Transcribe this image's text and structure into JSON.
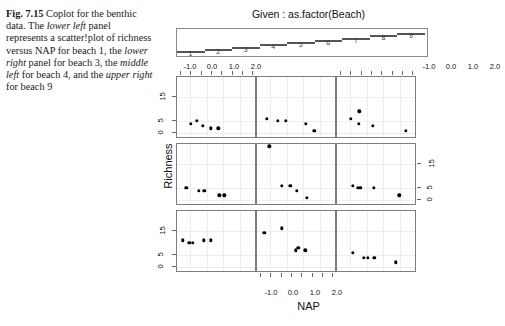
{
  "caption": {
    "fig_label": "Fig. 7.15",
    "line_1": "Coplot for the",
    "line_2_a": "benthic data. The ",
    "line_2_i": "lower left",
    "line_3": "panel represents a",
    "line_4": "scatter!plot of richness versus",
    "line_5_a": "NAP for beach 1, the ",
    "line_5_i": "lower",
    "line_6_i": "right",
    "line_6_b": " panel for beach 3, the",
    "line_7_i": "middle left",
    "line_7_b": " for beach 4, and",
    "line_8_a": "the ",
    "line_8_i": "upper right",
    "line_8_b": " for beach 9"
  },
  "given": {
    "title": "Given : as.factor(Beach)",
    "levels": [
      "1",
      "2",
      "3",
      "4",
      "5",
      "6",
      "7",
      "8",
      "9"
    ]
  },
  "axes": {
    "xlabel": "NAP",
    "ylabel": "Richness",
    "xticks": [
      "-1.0",
      "0.0",
      "1.0",
      "2.0"
    ],
    "xtick_values": [
      -1.0,
      0.0,
      1.0,
      2.0
    ],
    "yticks": [
      "0",
      "5",
      "15"
    ],
    "ytick_values": [
      0,
      5,
      15
    ],
    "xlim": [
      -1.8,
      2.9
    ],
    "ylim": [
      -1.5,
      23
    ]
  },
  "chart_data": {
    "type": "scatter",
    "title": "Given : as.factor(Beach)",
    "xlabel": "NAP",
    "ylabel": "Richness",
    "conditioning_variable": "as.factor(Beach)",
    "xlim": [
      -1.8,
      2.9
    ],
    "ylim": [
      -1.5,
      23
    ],
    "grid": true,
    "layout": "3x3 coplot, rows bottom-to-top = beaches 1-3, 4-6, 7-9",
    "panels": [
      {
        "beach": "1",
        "row": 2,
        "col": 0,
        "points": [
          {
            "x": -1.45,
            "y": 11
          },
          {
            "x": -1.05,
            "y": 10
          },
          {
            "x": -0.85,
            "y": 10
          },
          {
            "x": -0.2,
            "y": 11
          },
          {
            "x": 0.25,
            "y": 11
          }
        ]
      },
      {
        "beach": "2",
        "row": 2,
        "col": 1,
        "points": [
          {
            "x": -1.35,
            "y": 14
          },
          {
            "x": -0.3,
            "y": 16
          },
          {
            "x": 0.55,
            "y": 7
          },
          {
            "x": 0.7,
            "y": 8
          },
          {
            "x": 1.1,
            "y": 7
          }
        ]
      },
      {
        "beach": "3",
        "row": 2,
        "col": 2,
        "points": [
          {
            "x": -0.85,
            "y": 6
          },
          {
            "x": -0.2,
            "y": 4
          },
          {
            "x": 0.05,
            "y": 4
          },
          {
            "x": 0.45,
            "y": 4
          },
          {
            "x": 1.75,
            "y": 2
          }
        ]
      },
      {
        "beach": "4",
        "row": 1,
        "col": 0,
        "points": [
          {
            "x": -1.25,
            "y": 5
          },
          {
            "x": -0.5,
            "y": 4
          },
          {
            "x": -0.15,
            "y": 4
          },
          {
            "x": 0.75,
            "y": 2
          },
          {
            "x": 1.05,
            "y": 2
          }
        ]
      },
      {
        "beach": "5",
        "row": 1,
        "col": 1,
        "points": [
          {
            "x": -1.05,
            "y": 22
          },
          {
            "x": -0.3,
            "y": 6
          },
          {
            "x": 0.2,
            "y": 6
          },
          {
            "x": 0.6,
            "y": 4
          },
          {
            "x": 1.2,
            "y": 1
          }
        ]
      },
      {
        "beach": "6",
        "row": 1,
        "col": 2,
        "points": [
          {
            "x": -0.85,
            "y": 6
          },
          {
            "x": -0.55,
            "y": 5
          },
          {
            "x": -0.4,
            "y": 5
          },
          {
            "x": 0.4,
            "y": 5
          },
          {
            "x": 1.95,
            "y": 2
          }
        ]
      },
      {
        "beach": "7",
        "row": 0,
        "col": 0,
        "points": [
          {
            "x": -0.95,
            "y": 4
          },
          {
            "x": -0.6,
            "y": 5
          },
          {
            "x": -0.25,
            "y": 3
          },
          {
            "x": 0.25,
            "y": 2
          },
          {
            "x": 0.7,
            "y": 2
          }
        ]
      },
      {
        "beach": "8",
        "row": 0,
        "col": 1,
        "points": [
          {
            "x": -1.2,
            "y": 6
          },
          {
            "x": -0.55,
            "y": 5
          },
          {
            "x": -0.05,
            "y": 5
          },
          {
            "x": 1.15,
            "y": 4
          },
          {
            "x": 1.65,
            "y": 1
          }
        ]
      },
      {
        "beach": "9",
        "row": 0,
        "col": 2,
        "points": [
          {
            "x": -0.95,
            "y": 6
          },
          {
            "x": -0.45,
            "y": 9
          },
          {
            "x": -0.5,
            "y": 4
          },
          {
            "x": 0.35,
            "y": 3
          },
          {
            "x": 2.35,
            "y": 1
          }
        ]
      }
    ]
  }
}
